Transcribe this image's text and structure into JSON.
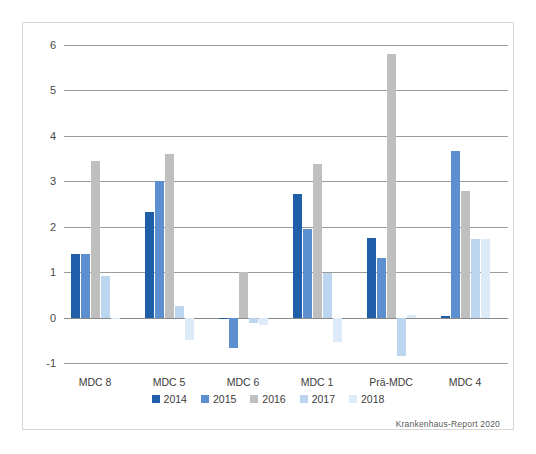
{
  "chart_data": {
    "type": "bar",
    "title": "",
    "subtitle": "",
    "xlabel": "",
    "ylabel": "",
    "categories": [
      "MDC 8",
      "MDC 5",
      "MDC 6",
      "MDC 1",
      "Prä-MDC",
      "MDC 4"
    ],
    "series": [
      {
        "name": "2014",
        "color": "#1f5fa9",
        "values": [
          1.4,
          2.32,
          -0.02,
          2.72,
          1.76,
          0.03
        ]
      },
      {
        "name": "2015",
        "color": "#5b8fcf",
        "values": [
          1.4,
          3.0,
          -0.66,
          1.94,
          1.31,
          3.66
        ]
      },
      {
        "name": "2016",
        "color": "#bfbfbf",
        "values": [
          3.45,
          3.61,
          1.01,
          3.37,
          5.8,
          2.79
        ]
      },
      {
        "name": "2017",
        "color": "#bcd6ef",
        "values": [
          0.91,
          0.26,
          -0.13,
          0.98,
          -0.85,
          1.73
        ]
      },
      {
        "name": "2018",
        "color": "#ddeaf7",
        "values": [
          0.0,
          -0.49,
          -0.16,
          -0.54,
          0.06,
          1.73
        ]
      }
    ],
    "ylim": [
      -1,
      6
    ],
    "yticks": [
      -1,
      0,
      1,
      2,
      3,
      4,
      5,
      6
    ],
    "ytick_labels": [
      "-1",
      "0",
      "1",
      "2",
      "3",
      "4",
      "5",
      "6"
    ],
    "grid": true,
    "legend_position": "bottom",
    "zero_line": 0,
    "annotations": [
      {
        "name": "source-note",
        "text": "Krankenhaus-Report 2020"
      }
    ]
  },
  "source_note": "Krankenhaus-Report 2020"
}
